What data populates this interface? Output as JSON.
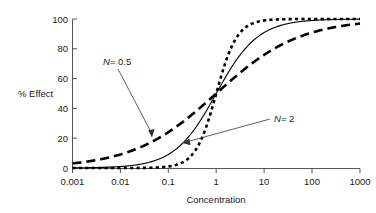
{
  "chart_data": {
    "type": "line",
    "title": "",
    "xlabel": "Concentration",
    "ylabel": "% Effect",
    "xscale": "log",
    "xlim": [
      0.001,
      1000
    ],
    "ylim": [
      0,
      100
    ],
    "grid": false,
    "legend_position": "inline-annotations",
    "xticks": [
      "0.001",
      "0.01",
      "0.1",
      "1",
      "10",
      "100",
      "1000"
    ],
    "xtick_values": [
      0.001,
      0.01,
      0.1,
      1,
      10,
      100,
      1000
    ],
    "yticks": [
      "0",
      "20",
      "40",
      "60",
      "80",
      "100"
    ],
    "ytick_values": [
      0,
      20,
      40,
      60,
      80,
      100
    ],
    "series": [
      {
        "name": "N = 0.5",
        "hill_coefficient": 0.5,
        "ec50": 1,
        "emax": 100,
        "style": "long-dashed",
        "linewidth": 2.6,
        "color": "#000000",
        "x": [
          0.001,
          0.003,
          0.01,
          0.03,
          0.1,
          0.3,
          1,
          3,
          10,
          30,
          100,
          300,
          1000
        ],
        "values": [
          3.1,
          5.2,
          9.1,
          14.8,
          24.0,
          35.4,
          50.0,
          63.4,
          76.0,
          84.6,
          90.9,
          94.5,
          96.9
        ]
      },
      {
        "name": "N = 1",
        "hill_coefficient": 1,
        "ec50": 1,
        "emax": 100,
        "style": "solid",
        "linewidth": 1.1,
        "color": "#000000",
        "x": [
          0.001,
          0.003,
          0.01,
          0.03,
          0.1,
          0.3,
          1,
          3,
          10,
          30,
          100,
          300,
          1000
        ],
        "values": [
          0.1,
          0.3,
          1.0,
          2.9,
          9.1,
          23.1,
          50.0,
          75.0,
          90.9,
          96.8,
          99.0,
          99.7,
          99.9
        ]
      },
      {
        "name": "N = 2",
        "hill_coefficient": 2,
        "ec50": 1,
        "emax": 100,
        "style": "short-dotted",
        "linewidth": 2.6,
        "color": "#000000",
        "x": [
          0.001,
          0.003,
          0.01,
          0.03,
          0.1,
          0.3,
          1,
          3,
          10,
          30,
          100,
          300,
          1000
        ],
        "values": [
          0.0,
          0.0,
          0.01,
          0.09,
          1.0,
          8.3,
          50.0,
          90.0,
          99.0,
          99.9,
          100.0,
          100.0,
          100.0
        ]
      }
    ],
    "annotations": [
      {
        "label": "N = 0.5",
        "label_italic_part": "N",
        "label_rest": "= 0.5",
        "points_to_series": "N = 0.5",
        "points_to_x": 0.03,
        "points_to_y": 22
      },
      {
        "label": "N = 2",
        "label_italic_part": "N",
        "label_rest": "= 2",
        "points_to_series": "N = 2",
        "points_to_x": 0.28,
        "points_to_y": 17
      }
    ]
  },
  "axis": {
    "x_title": "Concentration",
    "y_title": "% Effect",
    "x_tick_labels": [
      "0.001",
      "0.01",
      "0.1",
      "1",
      "10",
      "100",
      "1000"
    ],
    "y_tick_labels": [
      "0",
      "20",
      "40",
      "60",
      "80",
      "100"
    ]
  },
  "annotations": {
    "n05": {
      "italic": "N",
      "rest": "= 0.5"
    },
    "n2": {
      "italic": "N",
      "rest": "= 2"
    }
  },
  "colors": {
    "background": "#ffffff",
    "curve": "#000000",
    "axis": "#555555",
    "text": "#1a1a1a"
  }
}
